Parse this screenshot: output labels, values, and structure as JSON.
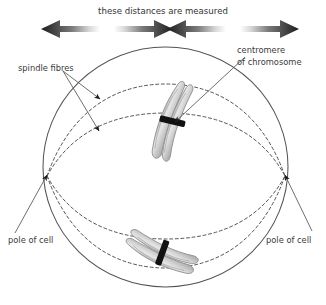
{
  "diagram": {
    "top_caption": "these distances are measured",
    "labels": {
      "spindle_fibres": "spindle fibres",
      "centromere_line1": "centromere",
      "centromere_line2": "of chromosome",
      "pole_left": "pole of cell",
      "pole_right": "pole of cell"
    },
    "icons": {
      "arrow_left_outer": "arrow-left-icon",
      "arrow_right_inner_left": "arrow-right-icon",
      "arrow_left_inner_right": "arrow-left-icon",
      "arrow_right_outer": "arrow-right-icon"
    },
    "colors": {
      "outline": "#555555",
      "dashed": "#555555",
      "text": "#3a3a3a",
      "arrow": "#1c1c1c",
      "chromatid_fill": "#cfcfcf",
      "chromatid_stroke": "#8a8a8a",
      "centromere": "#111111",
      "background": "#ffffff"
    },
    "structures": {
      "cell_membrane": "cell-outline-circle",
      "spindle_fibre_count": 4,
      "chromosome_top": "chromosome-top",
      "chromosome_bottom": "chromosome-bottom",
      "centromere_band_top": "centromere-band-top",
      "centromere_band_bottom": "centromere-band-bottom"
    }
  }
}
